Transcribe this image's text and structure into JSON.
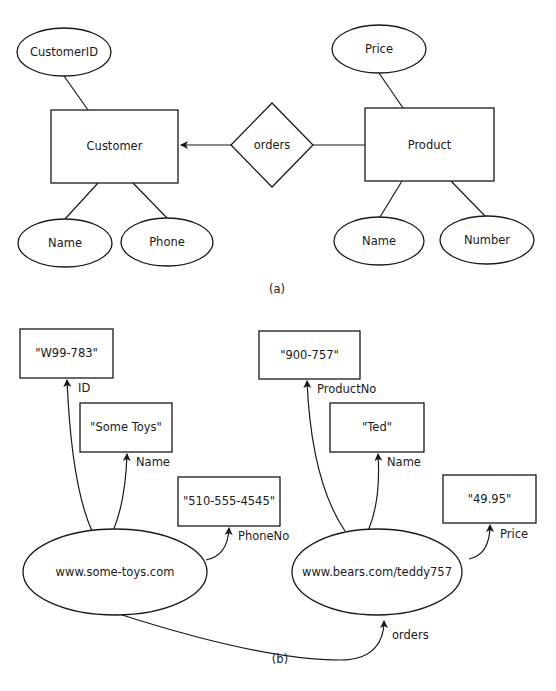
{
  "part_a": {
    "caption": "(a)",
    "entities": {
      "customer": "Customer",
      "product": "Product"
    },
    "relationship": "orders",
    "attributes": {
      "customer_id": "CustomerID",
      "customer_name": "Name",
      "customer_phone": "Phone",
      "product_price": "Price",
      "product_name": "Name",
      "product_number": "Number"
    }
  },
  "part_b": {
    "caption": "(b)",
    "resources": {
      "toys": "www.some-toys.com",
      "bear": "www.bears.com/teddy757"
    },
    "literals": {
      "toys_id": "\"W99-783\"",
      "toys_name": "\"Some Toys\"",
      "toys_phone": "\"510-555-4545\"",
      "bear_product_no": "\"900-757\"",
      "bear_name": "\"Ted\"",
      "bear_price": "\"49.95\""
    },
    "properties": {
      "id": "ID",
      "name": "Name",
      "phone_no": "PhoneNo",
      "product_no": "ProductNo",
      "bear_name": "Name",
      "price": "Price",
      "orders": "orders"
    }
  }
}
